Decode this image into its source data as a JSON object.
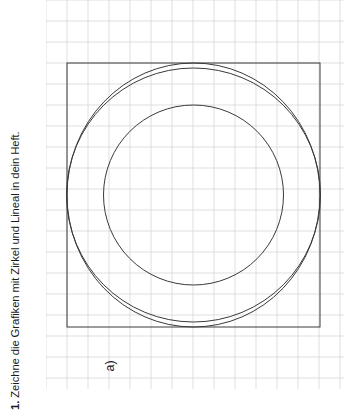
{
  "exercise": {
    "number": "1.",
    "text": "Zeichne die Grafiken mit Zirkel und Lineal in dein Heft.",
    "full": "1. Zeichne die Grafiken mit Zirkel und Lineal in dein Heft.",
    "sub_label": "a)"
  },
  "colors": {
    "page_background": "#ffffff",
    "grid_line": "#d7d7dd",
    "figure_stroke": "#3a3a3a",
    "text": "#1a1a1a"
  },
  "grid": {
    "cell_size_px": 21,
    "origin_x_px": 0,
    "origin_y_px": 0,
    "columns": 14,
    "rows": 18,
    "line_width_px": 0.8
  },
  "figure": {
    "stroke_width_px": 1.0,
    "square": {
      "x": 21,
      "y": 63,
      "width": 253,
      "height": 264
    },
    "center": {
      "x": 147.5,
      "y": 195
    },
    "outer_circle": {
      "cx": 147.5,
      "cy": 195,
      "r": 127
    },
    "inner_circle": {
      "cx": 147.5,
      "cy": 195,
      "r": 90
    },
    "corner_arcs": [
      {
        "name": "top-left-arc",
        "cx": 21,
        "cy": 63,
        "r": 127
      },
      {
        "name": "top-right-arc",
        "cx": 274,
        "cy": 63,
        "r": 127
      },
      {
        "name": "bottom-right-arc",
        "cx": 274,
        "cy": 327,
        "r": 127
      },
      {
        "name": "bottom-left-arc",
        "cx": 21,
        "cy": 327,
        "r": 127
      }
    ],
    "cusps": [
      {
        "name": "top-cusp",
        "x": 147.5,
        "y": 63
      },
      {
        "name": "right-cusp",
        "x": 274,
        "y": 195
      },
      {
        "name": "bottom-cusp",
        "x": 147.5,
        "y": 327
      },
      {
        "name": "left-cusp",
        "x": 21,
        "y": 195
      }
    ]
  }
}
